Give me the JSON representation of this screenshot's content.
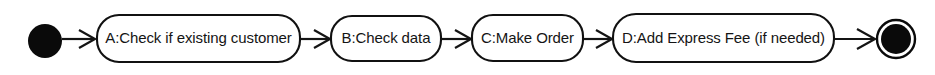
{
  "diagram": {
    "type": "uml-activity-diagram",
    "background_color": "#ffffff",
    "stroke_color": "#141414",
    "fill_color": "#ffffff",
    "text_color": "#141414",
    "nodes": [
      {
        "id": "start",
        "kind": "initial-node",
        "label": "",
        "shape": "filled-circle",
        "cx": 45,
        "cy": 41,
        "r": 17
      },
      {
        "id": "a",
        "kind": "action",
        "label": "A:Check if existing customer",
        "shape": "rounded-rectangle",
        "x": 97,
        "y": 15,
        "width": 203,
        "height": 47,
        "rx": 22
      },
      {
        "id": "b",
        "kind": "action",
        "label": "B:Check data",
        "shape": "rounded-rectangle",
        "x": 331,
        "y": 16,
        "width": 110,
        "height": 45,
        "rx": 21
      },
      {
        "id": "c",
        "kind": "action",
        "label": "C:Make Order",
        "shape": "rounded-rectangle",
        "x": 472,
        "y": 15,
        "width": 111,
        "height": 46,
        "rx": 21
      },
      {
        "id": "d",
        "kind": "action",
        "label": "D:Add Express Fee (if needed)",
        "shape": "rounded-rectangle",
        "x": 613,
        "y": 14,
        "width": 221,
        "height": 48,
        "rx": 23
      },
      {
        "id": "end",
        "kind": "final-node",
        "label": "",
        "shape": "bullseye-circle",
        "cx": 896,
        "cy": 39,
        "r_outer": 20,
        "r_inner": 15
      }
    ],
    "edges": [
      {
        "id": "e1",
        "from": "start",
        "to": "a",
        "label": "",
        "x1": 62,
        "x2": 97,
        "y": 39
      },
      {
        "id": "e2",
        "from": "a",
        "to": "b",
        "label": "",
        "x1": 300,
        "x2": 331,
        "y": 39
      },
      {
        "id": "e3",
        "from": "b",
        "to": "c",
        "label": "",
        "x1": 441,
        "x2": 472,
        "y": 39
      },
      {
        "id": "e4",
        "from": "c",
        "to": "d",
        "label": "",
        "x1": 583,
        "x2": 613,
        "y": 39
      },
      {
        "id": "e5",
        "from": "d",
        "to": "end",
        "label": "",
        "x1": 834,
        "x2": 876,
        "y": 39
      }
    ]
  }
}
